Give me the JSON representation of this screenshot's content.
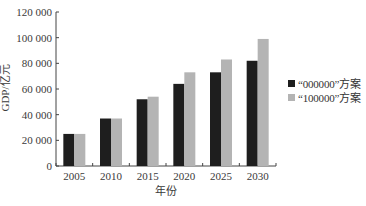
{
  "chart_data": {
    "type": "bar",
    "title": "",
    "xlabel": "年份",
    "ylabel": "GDP/亿元",
    "categories": [
      "2005",
      "2010",
      "2015",
      "2020",
      "2025",
      "2030"
    ],
    "series": [
      {
        "name": "“000000”方案",
        "color": "#1e1e1e",
        "values": [
          25000,
          37000,
          52000,
          64000,
          73000,
          82000
        ]
      },
      {
        "name": "“100000”方案",
        "color": "#b4b4b4",
        "values": [
          25000,
          37000,
          54000,
          73000,
          83000,
          99000
        ]
      }
    ],
    "ylim": [
      0,
      120000
    ],
    "yticks": [
      0,
      20000,
      40000,
      60000,
      80000,
      100000,
      120000
    ],
    "ytick_labels": [
      "0",
      "20 000",
      "40 000",
      "60 000",
      "80 000",
      "100 000",
      "120 000"
    ],
    "grid": false,
    "legend_position": "right"
  },
  "legend": {
    "items": [
      {
        "label": "“000000”方案",
        "color": "#1e1e1e"
      },
      {
        "label": "“100000”方案",
        "color": "#b4b4b4"
      }
    ]
  }
}
